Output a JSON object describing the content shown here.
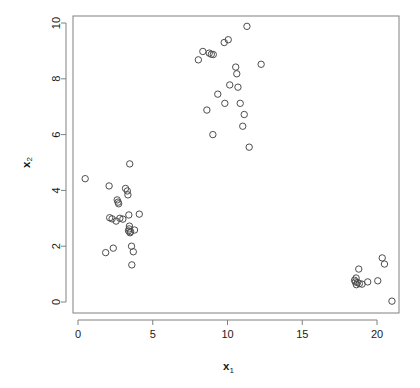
{
  "chart_data": {
    "type": "scatter",
    "title": "",
    "xlabel": "x_1",
    "xlabel_base": "x",
    "xlabel_sub": "1",
    "ylabel": "x_2",
    "ylabel_base": "x",
    "ylabel_sub": "2",
    "xlim": [
      -0.45,
      21.95
    ],
    "ylim": [
      -0.37,
      10.4
    ],
    "xticks": [
      0,
      5,
      10,
      15,
      20
    ],
    "xtick_labels": [
      "0",
      "5",
      "10",
      "15",
      "20"
    ],
    "yticks": [
      0,
      2,
      4,
      6,
      8,
      10
    ],
    "ytick_labels": [
      "0",
      "2",
      "4",
      "6",
      "8",
      "10"
    ],
    "grid": false,
    "legend": false,
    "marker": "open-circle",
    "marker_color": "#4d4d4d",
    "marker_radius_px": 3.2,
    "n_points": 61,
    "clusters": 3,
    "points": [
      [
        0.48,
        4.42
      ],
      [
        1.85,
        1.77
      ],
      [
        2.08,
        4.16
      ],
      [
        2.12,
        3.02
      ],
      [
        2.28,
        2.98
      ],
      [
        2.36,
        1.93
      ],
      [
        2.55,
        2.9
      ],
      [
        2.62,
        3.66
      ],
      [
        2.68,
        3.58
      ],
      [
        2.72,
        3.52
      ],
      [
        2.8,
        3.0
      ],
      [
        3.0,
        2.97
      ],
      [
        3.18,
        4.07
      ],
      [
        3.3,
        3.98
      ],
      [
        3.34,
        3.84
      ],
      [
        3.38,
        2.55
      ],
      [
        3.4,
        3.12
      ],
      [
        3.42,
        2.62
      ],
      [
        3.44,
        2.72
      ],
      [
        3.46,
        4.95
      ],
      [
        3.48,
        2.48
      ],
      [
        3.52,
        2.52
      ],
      [
        3.58,
        2.0
      ],
      [
        3.6,
        1.33
      ],
      [
        3.7,
        1.8
      ],
      [
        3.78,
        2.58
      ],
      [
        4.1,
        3.15
      ],
      [
        8.05,
        8.68
      ],
      [
        8.35,
        8.98
      ],
      [
        8.62,
        6.88
      ],
      [
        8.78,
        8.92
      ],
      [
        8.92,
        8.88
      ],
      [
        9.02,
        6.0
      ],
      [
        9.05,
        8.87
      ],
      [
        9.35,
        7.45
      ],
      [
        9.78,
        9.3
      ],
      [
        9.82,
        7.12
      ],
      [
        10.05,
        9.4
      ],
      [
        10.15,
        7.78
      ],
      [
        10.55,
        8.42
      ],
      [
        10.62,
        8.18
      ],
      [
        10.7,
        7.7
      ],
      [
        10.85,
        7.12
      ],
      [
        11.02,
        6.3
      ],
      [
        11.12,
        6.72
      ],
      [
        11.3,
        9.88
      ],
      [
        11.45,
        5.55
      ],
      [
        12.25,
        8.52
      ],
      [
        18.5,
        0.78
      ],
      [
        18.55,
        0.72
      ],
      [
        18.6,
        0.86
      ],
      [
        18.62,
        0.62
      ],
      [
        18.7,
        0.7
      ],
      [
        18.78,
        1.18
      ],
      [
        18.82,
        0.66
      ],
      [
        19.0,
        0.64
      ],
      [
        19.38,
        0.72
      ],
      [
        20.05,
        0.76
      ],
      [
        20.35,
        1.58
      ],
      [
        20.5,
        1.36
      ],
      [
        21.0,
        0.03
      ]
    ]
  },
  "plot": {
    "frame": {
      "left": 73,
      "top": 16,
      "right": 399,
      "bottom": 313
    },
    "scale": {
      "x0_px": 78,
      "px_per_x": 14.95,
      "y0_px": 302,
      "px_per_y": 27.9
    },
    "frame_color": "#808080",
    "background": "#ffffff"
  }
}
